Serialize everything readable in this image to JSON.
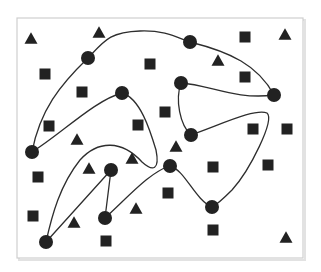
{
  "diagram": {
    "canvas": {
      "width": 321,
      "height": 272,
      "background": "#ffffff"
    },
    "frame": {
      "x": 17,
      "y": 18,
      "width": 286,
      "height": 240,
      "stroke": "#cfcfcf",
      "shadow": "#e2e2e2"
    },
    "colors": {
      "shape_fill": "#222222",
      "curve_stroke": "#2e2e2e"
    },
    "circles": [
      {
        "x": 88,
        "y": 58,
        "r": 7
      },
      {
        "x": 190,
        "y": 42,
        "r": 7
      },
      {
        "x": 122,
        "y": 93,
        "r": 7
      },
      {
        "x": 181,
        "y": 83,
        "r": 7
      },
      {
        "x": 274,
        "y": 95,
        "r": 7
      },
      {
        "x": 32,
        "y": 152,
        "r": 7
      },
      {
        "x": 191,
        "y": 135,
        "r": 7
      },
      {
        "x": 111,
        "y": 170,
        "r": 7
      },
      {
        "x": 170,
        "y": 166,
        "r": 7
      },
      {
        "x": 105,
        "y": 218,
        "r": 7
      },
      {
        "x": 212,
        "y": 207,
        "r": 7
      },
      {
        "x": 46,
        "y": 242,
        "r": 7
      }
    ],
    "squares": [
      {
        "x": 45,
        "y": 74
      },
      {
        "x": 82,
        "y": 92
      },
      {
        "x": 150,
        "y": 64
      },
      {
        "x": 245,
        "y": 37
      },
      {
        "x": 245,
        "y": 77
      },
      {
        "x": 49,
        "y": 126
      },
      {
        "x": 138,
        "y": 125
      },
      {
        "x": 165,
        "y": 112
      },
      {
        "x": 253,
        "y": 129
      },
      {
        "x": 287,
        "y": 129
      },
      {
        "x": 38,
        "y": 177
      },
      {
        "x": 213,
        "y": 167
      },
      {
        "x": 268,
        "y": 165
      },
      {
        "x": 168,
        "y": 193
      },
      {
        "x": 33,
        "y": 216
      },
      {
        "x": 213,
        "y": 230
      },
      {
        "x": 106,
        "y": 241
      }
    ],
    "square_size": 11,
    "triangles": [
      {
        "x": 31,
        "y": 38
      },
      {
        "x": 99,
        "y": 32
      },
      {
        "x": 285,
        "y": 34
      },
      {
        "x": 218,
        "y": 60
      },
      {
        "x": 77,
        "y": 139
      },
      {
        "x": 89,
        "y": 168
      },
      {
        "x": 132,
        "y": 158
      },
      {
        "x": 176,
        "y": 146
      },
      {
        "x": 74,
        "y": 222
      },
      {
        "x": 136,
        "y": 208
      },
      {
        "x": 286,
        "y": 237
      }
    ],
    "triangle_size": 13,
    "curves": [
      {
        "name": "outer-loop",
        "d": "M 32 152 C 40 110, 60 85, 88 58 C 105 40, 110 32, 140 31 C 165 30, 178 38, 190 42 C 230 52, 258 65, 274 95"
      },
      {
        "name": "left-arc",
        "d": "M 32 152 C 60 135, 95 100, 122 93 C 140 98, 150 130, 156 150 C 160 170, 153 172, 142 162 C 122 140, 98 140, 80 160 C 60 185, 52 215, 46 242"
      },
      {
        "name": "right-triangle-loop",
        "d": "M 181 83 C 210 85, 235 100, 274 95"
      },
      {
        "name": "right-triangle-side",
        "d": "M 181 83 C 175 100, 180 125, 191 135"
      },
      {
        "name": "right-tail",
        "d": "M 191 135 C 220 125, 255 108, 267 113 C 275 120, 250 170, 232 190 C 222 200, 216 205, 212 207"
      },
      {
        "name": "bottom-wave",
        "d": "M 105 218 C 130 195, 150 172, 170 166 C 185 170, 195 200, 212 207"
      },
      {
        "name": "v-left",
        "d": "M 46 242 L 111 170"
      },
      {
        "name": "v-right",
        "d": "M 111 170 L 105 218"
      }
    ]
  }
}
